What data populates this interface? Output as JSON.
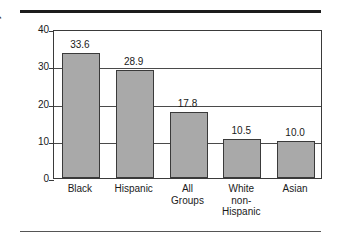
{
  "chart_data": {
    "type": "bar",
    "title": "",
    "xlabel": "",
    "ylabel": "Poverty rate",
    "categories": [
      "Black",
      "Hispanic",
      "All Groups",
      "White non-Hispanic",
      "Asian"
    ],
    "category_lines": [
      [
        "Black"
      ],
      [
        "Hispanic"
      ],
      [
        "All",
        "Groups"
      ],
      [
        "White",
        "non-",
        "Hispanic"
      ],
      [
        "Asian"
      ]
    ],
    "values": [
      33.6,
      28.9,
      17.8,
      10.5,
      10.0
    ],
    "value_labels": [
      "33.6",
      "28.9",
      "17.8",
      "10.5",
      "10.0"
    ],
    "ylim": [
      0,
      40
    ],
    "yticks": [
      0,
      10,
      20,
      30,
      40
    ],
    "ytick_labels": [
      "0",
      "10",
      "20",
      "30",
      "40"
    ],
    "grid": true,
    "gridlines_at": [
      10,
      20,
      30
    ],
    "legend": null,
    "bar_color": "#a9a9a9",
    "bar_edge_color": "#3a3a3a",
    "frame_color": "#3a3a3a",
    "rule_color": "#1d1d1d"
  },
  "figure": {
    "top_rule": "",
    "bottom_rule": ""
  }
}
